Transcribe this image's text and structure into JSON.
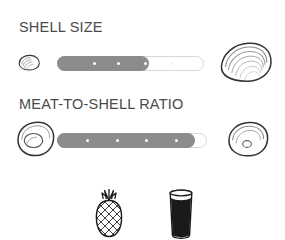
{
  "card": {
    "background_color": "#ffffff",
    "ink_color": "#333333",
    "label_color": "#4a4a4a",
    "fill_color": "#8c8c8c",
    "track_color": "#ffffff",
    "track_border_color": "#d8d8d8"
  },
  "sections": [
    {
      "id": "shell-size",
      "label": "SHELL SIZE",
      "left_icon": "small-oyster-shell-icon",
      "right_icon": "large-oyster-shell-icon",
      "scale_min_hint": "small shell",
      "scale_max_hint": "large shell",
      "ticks_total": 5,
      "value": 3,
      "fill_percent": 62
    },
    {
      "id": "meat-ratio",
      "label": "MEAT-TO-SHELL RATIO",
      "left_icon": "oyster-full-meat-icon",
      "right_icon": "oyster-small-meat-icon",
      "scale_min_hint": "plump meat",
      "scale_max_hint": "lean meat",
      "ticks_total": 5,
      "value": 4,
      "fill_percent": 92
    }
  ],
  "pairings": [
    {
      "id": "pineapple",
      "icon": "pineapple-icon",
      "label": "Pineapple"
    },
    {
      "id": "stout",
      "icon": "stout-glass-icon",
      "label": "Stout"
    }
  ]
}
